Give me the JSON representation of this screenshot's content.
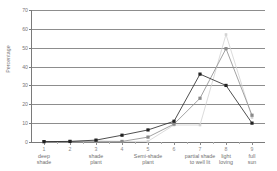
{
  "chart_data": {
    "type": "line",
    "title": "",
    "xlabel": "",
    "ylabel": "Percentage",
    "ylim": [
      0,
      70
    ],
    "yticks": [
      0,
      10,
      20,
      30,
      40,
      50,
      60,
      70
    ],
    "xlim": [
      0.5,
      9.5
    ],
    "x": [
      1,
      2,
      3,
      4,
      5,
      6,
      7,
      8,
      9
    ],
    "xticks": [
      1,
      2,
      3,
      4,
      5,
      6,
      7,
      8,
      9
    ],
    "xtick_labels": [
      "1",
      "2",
      "3",
      "4",
      "5",
      "6",
      "7",
      "8",
      "9"
    ],
    "category_labels": [
      {
        "x": 1,
        "text": "deep\nshade"
      },
      {
        "x": 3,
        "text": "shade\nplant"
      },
      {
        "x": 5,
        "text": "Semi-shade\nplant"
      },
      {
        "x": 7,
        "text": "partial shade\nto well lit"
      },
      {
        "x": 8,
        "text": "light\nloving"
      },
      {
        "x": 9,
        "text": "full\nsun"
      }
    ],
    "grid": true,
    "legend": "none",
    "series": [
      {
        "name": "series-dark",
        "color": "#222222",
        "marker": "square-filled",
        "values": [
          0.2,
          0.3,
          1.0,
          3.6,
          6.4,
          11.0,
          36.0,
          30.0,
          10.0
        ]
      },
      {
        "name": "series-mid",
        "color": "#8a8a8a",
        "marker": "square-filled",
        "values": [
          0.2,
          0.3,
          0.4,
          0.3,
          2.6,
          9.5,
          23.2,
          49.5,
          14.2
        ]
      },
      {
        "name": "series-light",
        "color": "#d2d2d2",
        "marker": "square-filled",
        "values": [
          0.1,
          0.1,
          0.2,
          0.2,
          0.4,
          9.0,
          9.0,
          57.0,
          13.0
        ]
      }
    ]
  },
  "axes": {
    "y_axis_title": "Percentage"
  }
}
